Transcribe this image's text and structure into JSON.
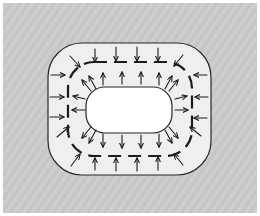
{
  "figure": {
    "canvas": {
      "width": 260,
      "height": 216
    },
    "background": {
      "page_color": "#ffffff",
      "field_color": "#c9c9c9",
      "texture": "diagonal-hatch",
      "texture_color": "#bdbdbd",
      "margin_px": 3
    },
    "shapes": {
      "outer_region": {
        "name": "outer-basin-boundary",
        "kind": "rounded-rect",
        "x": 45,
        "y": 40,
        "width": 163,
        "height": 132,
        "corner_radius": 34,
        "fill": "#efefef",
        "stroke": "#262626",
        "stroke_width": 1.2,
        "dashed": false
      },
      "limit_cycle": {
        "name": "limit-cycle-dashed-curve",
        "kind": "rounded-rect",
        "x": 65,
        "y": 59,
        "width": 124,
        "height": 94,
        "corner_radius": 26,
        "fill": "none",
        "stroke": "#1c1c1c",
        "stroke_width": 2.2,
        "dashed": true,
        "dash_pattern": "13 7"
      },
      "inner_region": {
        "name": "inner-region-boundary",
        "kind": "rounded-rect",
        "x": 83,
        "y": 84,
        "width": 86,
        "height": 46,
        "corner_radius": 19,
        "fill": "#ffffff",
        "stroke": "#262626",
        "stroke_width": 1.2,
        "dashed": false
      }
    },
    "arrows": {
      "stroke": "#1c1c1c",
      "stroke_width": 1.1,
      "head_length": 4.5,
      "outer_group": {
        "name": "inward-arrows",
        "direction": "inward",
        "count": 20,
        "segments": [
          {
            "x1": 92,
            "y1": 46,
            "x2": 92,
            "y2": 59
          },
          {
            "x1": 113,
            "y1": 44,
            "x2": 113,
            "y2": 58
          },
          {
            "x1": 134,
            "y1": 44,
            "x2": 134,
            "y2": 58
          },
          {
            "x1": 155,
            "y1": 45,
            "x2": 155,
            "y2": 58
          },
          {
            "x1": 67,
            "y1": 53,
            "x2": 77,
            "y2": 64
          },
          {
            "x1": 180,
            "y1": 52,
            "x2": 171,
            "y2": 63
          },
          {
            "x1": 48,
            "y1": 72,
            "x2": 62,
            "y2": 72
          },
          {
            "x1": 47,
            "y1": 94,
            "x2": 61,
            "y2": 94
          },
          {
            "x1": 47,
            "y1": 114,
            "x2": 61,
            "y2": 114
          },
          {
            "x1": 204,
            "y1": 72,
            "x2": 191,
            "y2": 72
          },
          {
            "x1": 205,
            "y1": 94,
            "x2": 192,
            "y2": 94
          },
          {
            "x1": 204,
            "y1": 115,
            "x2": 191,
            "y2": 115
          },
          {
            "x1": 54,
            "y1": 134,
            "x2": 66,
            "y2": 124
          },
          {
            "x1": 198,
            "y1": 133,
            "x2": 187,
            "y2": 124
          },
          {
            "x1": 68,
            "y1": 163,
            "x2": 77,
            "y2": 151
          },
          {
            "x1": 92,
            "y1": 167,
            "x2": 92,
            "y2": 155
          },
          {
            "x1": 113,
            "y1": 168,
            "x2": 113,
            "y2": 155
          },
          {
            "x1": 134,
            "y1": 168,
            "x2": 134,
            "y2": 155
          },
          {
            "x1": 155,
            "y1": 167,
            "x2": 155,
            "y2": 154
          },
          {
            "x1": 180,
            "y1": 162,
            "x2": 171,
            "y2": 151
          }
        ]
      },
      "inner_group": {
        "name": "outward-arrows",
        "direction": "outward",
        "count": 20,
        "segments": [
          {
            "x1": 100,
            "y1": 82,
            "x2": 100,
            "y2": 70
          },
          {
            "x1": 119,
            "y1": 81,
            "x2": 119,
            "y2": 69
          },
          {
            "x1": 138,
            "y1": 81,
            "x2": 138,
            "y2": 69
          },
          {
            "x1": 156,
            "y1": 82,
            "x2": 156,
            "y2": 70
          },
          {
            "x1": 88,
            "y1": 88,
            "x2": 79,
            "y2": 77
          },
          {
            "x1": 166,
            "y1": 88,
            "x2": 175,
            "y2": 77
          },
          {
            "x1": 82,
            "y1": 96,
            "x2": 70,
            "y2": 93
          },
          {
            "x1": 82,
            "y1": 107,
            "x2": 69,
            "y2": 107
          },
          {
            "x1": 172,
            "y1": 96,
            "x2": 184,
            "y2": 93
          },
          {
            "x1": 172,
            "y1": 107,
            "x2": 185,
            "y2": 107
          },
          {
            "x1": 88,
            "y1": 124,
            "x2": 79,
            "y2": 135
          },
          {
            "x1": 166,
            "y1": 124,
            "x2": 175,
            "y2": 135
          },
          {
            "x1": 100,
            "y1": 131,
            "x2": 100,
            "y2": 144
          },
          {
            "x1": 119,
            "y1": 132,
            "x2": 119,
            "y2": 145
          },
          {
            "x1": 138,
            "y1": 132,
            "x2": 138,
            "y2": 145
          },
          {
            "x1": 156,
            "y1": 131,
            "x2": 156,
            "y2": 144
          },
          {
            "x1": 93,
            "y1": 86,
            "x2": 86,
            "y2": 73
          },
          {
            "x1": 162,
            "y1": 86,
            "x2": 169,
            "y2": 73
          },
          {
            "x1": 93,
            "y1": 127,
            "x2": 86,
            "y2": 140
          },
          {
            "x1": 162,
            "y1": 127,
            "x2": 169,
            "y2": 140
          }
        ]
      }
    }
  }
}
